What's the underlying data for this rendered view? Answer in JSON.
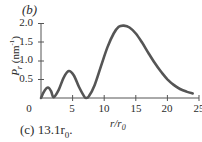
{
  "panel_label": "(b)",
  "answer_text": "(c) 13.1r",
  "answer_sub": "0",
  "answer_suffix": ".",
  "chart_data": {
    "type": "line",
    "title": "",
    "xlabel": "r/r0",
    "ylabel": "P_r (nm^-1)",
    "xlim": [
      0,
      25
    ],
    "ylim": [
      0,
      2.0
    ],
    "x_ticks": [
      "0",
      "5",
      "10",
      "15",
      "20",
      "25"
    ],
    "y_ticks": [
      "0.5",
      "1.0",
      "1.5",
      "2.0"
    ],
    "grid": false,
    "legend": null,
    "series": [
      {
        "name": "P_r",
        "x": [
          0,
          0.5,
          1.1,
          1.6,
          2.0,
          2.8,
          3.6,
          4.4,
          5.2,
          6.0,
          6.8,
          7.1,
          7.6,
          8.5,
          9.5,
          10.5,
          11.5,
          12.3,
          13.1,
          14.0,
          15.0,
          16.0,
          17.0,
          18.0,
          19.0,
          20.0,
          21.0,
          22.0,
          23.0,
          24.0
        ],
        "y": [
          0,
          0.18,
          0.28,
          0.18,
          0.02,
          0.22,
          0.55,
          0.72,
          0.6,
          0.3,
          0.05,
          0.0,
          0.05,
          0.35,
          0.85,
          1.35,
          1.72,
          1.9,
          1.93,
          1.88,
          1.72,
          1.48,
          1.2,
          0.93,
          0.7,
          0.5,
          0.35,
          0.24,
          0.17,
          0.12
        ]
      }
    ],
    "annotations": [
      "(b)"
    ]
  }
}
